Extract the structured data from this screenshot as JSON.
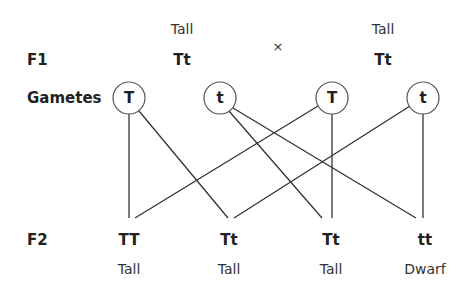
{
  "parents": {
    "left": {
      "phenotype": "Tall",
      "genotype": "Tt"
    },
    "cross_symbol": "×",
    "right": {
      "phenotype": "Tall",
      "genotype": "Tt"
    }
  },
  "row_labels": {
    "f1": "F1",
    "gametes": "Gametes",
    "f2": "F2"
  },
  "gametes": [
    {
      "allele": "T",
      "x": 129,
      "y": 98
    },
    {
      "allele": "t",
      "x": 220,
      "y": 98
    },
    {
      "allele": "T",
      "x": 332,
      "y": 98
    },
    {
      "allele": "t",
      "x": 423,
      "y": 98
    }
  ],
  "offspring": [
    {
      "genotype": "TT",
      "phenotype": "Tall"
    },
    {
      "genotype": "Tt",
      "phenotype": "Tall"
    },
    {
      "genotype": "Tt",
      "phenotype": "Tall"
    },
    {
      "genotype": "tt",
      "phenotype": "Dwarf"
    }
  ],
  "colors": {
    "line": "#333333",
    "circle_stroke": "#555555",
    "text": "#222222"
  }
}
